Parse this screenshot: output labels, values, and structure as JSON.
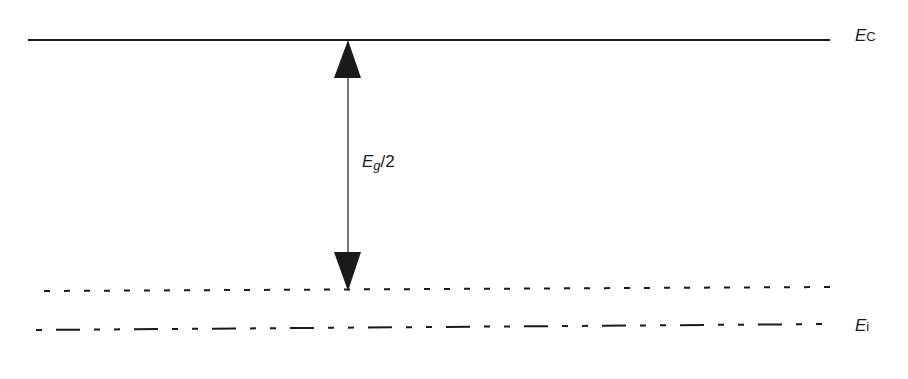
{
  "diagram": {
    "title": "",
    "levels": [
      {
        "id": "conduction-band",
        "label_main": "E",
        "label_sub": "C",
        "style": "solid",
        "y": 40
      },
      {
        "id": "fermi-level",
        "label_main": "",
        "label_sub": "",
        "style": "dotted",
        "y": 290
      },
      {
        "id": "intrinsic-level",
        "label_main": "E",
        "label_sub": "i",
        "style": "dash-dot",
        "y": 325
      }
    ],
    "arrow": {
      "label_main": "E",
      "label_sub": "g",
      "label_suffix": "/2",
      "direction": "double"
    }
  },
  "labels": {
    "ec_main": "E",
    "ec_sub": "C",
    "ei_main": "E",
    "ei_sub": "i",
    "eg_main": "E",
    "eg_sub": "g",
    "eg_suffix": "/2"
  },
  "colors": {
    "line": "#1a1a1a",
    "background": "#ffffff"
  }
}
